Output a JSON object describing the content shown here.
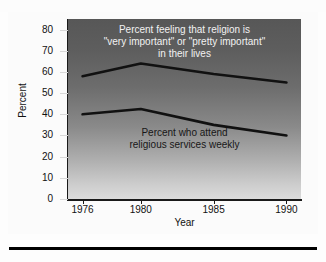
{
  "figure": {
    "top_cut_text": "",
    "bottom_rule": "divider"
  },
  "chart_data": {
    "type": "line",
    "title": "",
    "xlabel": "Year",
    "ylabel": "Percent",
    "x": [
      1976,
      1980,
      1985,
      1990
    ],
    "xlim": [
      1975,
      1991
    ],
    "ylim": [
      0,
      85
    ],
    "ytick_labels": [
      "0",
      "10",
      "20",
      "30",
      "40",
      "50",
      "60",
      "70",
      "80"
    ],
    "yticks": [
      0,
      10,
      20,
      30,
      40,
      50,
      60,
      70,
      80
    ],
    "xtick_labels": [
      "1976",
      "1980",
      "1985",
      "1990"
    ],
    "grid": false,
    "legend": "none",
    "series": [
      {
        "name": "Percent feeling that religion is \"very important\" or \"pretty important\" in their lives",
        "values": [
          58,
          64,
          59,
          55
        ],
        "color": "#111111"
      },
      {
        "name": "Percent who attend religious services weekly",
        "values": [
          40,
          42.5,
          35,
          30
        ],
        "color": "#111111"
      }
    ],
    "annotations": [
      {
        "name": "upper-series-label",
        "lines": [
          "Percent feeling that religion is",
          "\"very important\" or \"pretty important\"",
          "in their lives"
        ],
        "color": "#f2f2f2"
      },
      {
        "name": "lower-series-label",
        "lines": [
          "Percent who attend",
          "religious services weekly"
        ],
        "color": "#171717"
      }
    ],
    "background": {
      "plot_gradient_top": "#575757",
      "plot_gradient_bottom": "#dcdcdc",
      "page": "#ffffff"
    }
  }
}
